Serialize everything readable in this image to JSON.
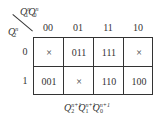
{
  "kmap": {
    "col_var": {
      "base1": "Q",
      "sub1": "1",
      "sup1": "n",
      "base2": "Q",
      "sub2": "0",
      "sup2": "n"
    },
    "row_var": {
      "base": "Q",
      "sub": "2",
      "sup": "n"
    },
    "col_headers": [
      "00",
      "01",
      "11",
      "10"
    ],
    "row_headers": [
      "0",
      "1"
    ],
    "cells": [
      [
        "×",
        "011",
        "111",
        "×"
      ],
      [
        "001",
        "×",
        "110",
        "100"
      ]
    ],
    "output_label": {
      "parts": [
        {
          "base": "Q",
          "sub": "2",
          "sup": "n+1"
        },
        {
          "base": "Q",
          "sub": "1",
          "sup": "n+1"
        },
        {
          "base": "Q",
          "sub": "0",
          "sup": "n+1"
        }
      ]
    }
  }
}
